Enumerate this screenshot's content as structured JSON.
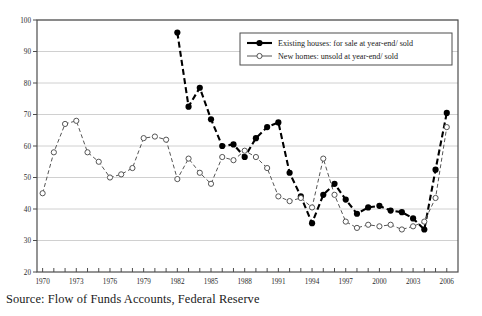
{
  "caption": "Source: Flow of Funds Accounts, Federal Reserve",
  "colors": {
    "frame": "#4d4d4d",
    "grid": "#d0d0d0",
    "series_existing": "#000000",
    "series_new": "#555555",
    "text": "#1a1a1a",
    "background": "#ffffff"
  },
  "legend": {
    "position": "top-right",
    "entries": [
      {
        "label": "Existing houses: for sale at year-end/ sold",
        "marker": "filled-circle",
        "line": "dashed-thick"
      },
      {
        "label": "New homes: unsold at year-end/ sold",
        "marker": "open-circle",
        "line": "dashed-thin"
      }
    ]
  },
  "chart_data": {
    "type": "line",
    "title": "",
    "xlabel": "",
    "ylabel": "",
    "xlim": [
      1969.5,
      2007.0
    ],
    "ylim": [
      20,
      100
    ],
    "yticks": [
      20,
      30,
      40,
      50,
      60,
      70,
      80,
      90,
      100
    ],
    "xticks": [
      1970,
      1971,
      1972,
      1973,
      1974,
      1975,
      1976,
      1977,
      1978,
      1979,
      1980,
      1981,
      1982,
      1983,
      1984,
      1985,
      1986,
      1987,
      1988,
      1989,
      1990,
      1991,
      1992,
      1993,
      1994,
      1995,
      1996,
      1997,
      1998,
      1999,
      2000,
      2001,
      2002,
      2003,
      2004,
      2005,
      2006
    ],
    "xtick_labels": [
      {
        "x": 1970,
        "label": "1970"
      },
      {
        "x": 1973,
        "label": "1973"
      },
      {
        "x": 1976,
        "label": "1976"
      },
      {
        "x": 1979,
        "label": "1979"
      },
      {
        "x": 1982,
        "label": "1982"
      },
      {
        "x": 1985,
        "label": "1985"
      },
      {
        "x": 1988,
        "label": "1988"
      },
      {
        "x": 1991,
        "label": "1991"
      },
      {
        "x": 1994,
        "label": "1994"
      },
      {
        "x": 1997,
        "label": "1997"
      },
      {
        "x": 2000,
        "label": "2000"
      },
      {
        "x": 2003,
        "label": "2003"
      },
      {
        "x": 2006,
        "label": "2006"
      }
    ],
    "grid": "horizontal",
    "legend_position": "top-right",
    "series": [
      {
        "name": "Existing houses: for sale at year-end/ sold",
        "marker": "filled-circle",
        "x": [
          1982,
          1983,
          1984,
          1985,
          1986,
          1987,
          1988,
          1989,
          1990,
          1991,
          1992,
          1993,
          1994,
          1995,
          1996,
          1997,
          1998,
          1999,
          2000,
          2001,
          2002,
          2003,
          2004,
          2005,
          2006
        ],
        "values": [
          96.0,
          72.5,
          78.5,
          68.5,
          60.0,
          60.5,
          56.5,
          62.5,
          66.0,
          67.5,
          51.5,
          44.0,
          35.5,
          44.5,
          48.0,
          43.0,
          38.5,
          40.5,
          41.0,
          39.5,
          39.0,
          37.0,
          33.5,
          52.5,
          70.5
        ]
      },
      {
        "name": "New homes: unsold at year-end/ sold",
        "marker": "open-circle",
        "x": [
          1970,
          1971,
          1972,
          1973,
          1974,
          1975,
          1976,
          1977,
          1978,
          1979,
          1980,
          1981,
          1982,
          1983,
          1984,
          1985,
          1986,
          1987,
          1988,
          1989,
          1990,
          1991,
          1992,
          1993,
          1994,
          1995,
          1996,
          1997,
          1998,
          1999,
          2000,
          2001,
          2002,
          2003,
          2004,
          2005,
          2006
        ],
        "values": [
          45.0,
          58.0,
          67.0,
          68.0,
          58.0,
          55.0,
          50.0,
          51.0,
          53.0,
          62.5,
          63.0,
          62.0,
          49.5,
          56.0,
          51.5,
          48.0,
          56.5,
          55.5,
          58.5,
          56.5,
          53.0,
          44.0,
          42.5,
          43.5,
          40.5,
          56.0,
          44.5,
          36.0,
          34.0,
          35.0,
          34.5,
          35.0,
          33.5,
          34.5,
          36.0,
          43.5,
          66.0
        ]
      }
    ]
  }
}
